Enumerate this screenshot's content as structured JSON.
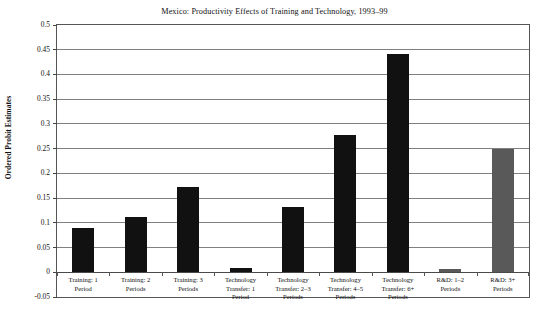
{
  "chart_data": {
    "type": "bar",
    "title": "Mexico: Productivity Effects of Training and Technology, 1993–99",
    "xlabel": "",
    "ylabel": "Ordered Probit Estimates",
    "ylim": [
      -0.05,
      0.5
    ],
    "ytick_step": 0.05,
    "grid": true,
    "legend": "none",
    "categories": [
      "Training: 1 Period",
      "Training: 2 Periods",
      "Training: 3 Periods",
      "Technology Transfer: 1 Period",
      "Technology Transfer: 2–3 Periods",
      "Technology Transfer: 4–5 Periods",
      "Technology Transfer: 6+ Periods",
      "R&D: 1–2 Periods",
      "R&D: 3+ Periods"
    ],
    "category_lines": [
      [
        "Training: 1",
        "Period"
      ],
      [
        "Training: 2",
        "Periods"
      ],
      [
        "Training: 3",
        "Periods"
      ],
      [
        "Technology",
        "Transfer: 1",
        "Period"
      ],
      [
        "Technology",
        "Transfer: 2–3",
        "Periods"
      ],
      [
        "Technology",
        "Transfer: 4–5",
        "Periods"
      ],
      [
        "Technology",
        "Transfer: 6+",
        "Periods"
      ],
      [
        "R&D: 1–2",
        "Periods"
      ],
      [
        "R&D: 3+",
        "Periods"
      ]
    ],
    "values": [
      0.09,
      0.112,
      0.172,
      0.008,
      0.133,
      0.277,
      0.442,
      0.007,
      0.249
    ],
    "bar_colors": [
      "#111111",
      "#111111",
      "#111111",
      "#111111",
      "#111111",
      "#111111",
      "#111111",
      "#595959",
      "#595959"
    ],
    "ytick_labels": [
      "0.5",
      "0.45",
      "0.4",
      "0.35",
      "0.3",
      "0.25",
      "0.2",
      "0.15",
      "0.1",
      "0.05",
      "0",
      "-0.05"
    ],
    "ytick_values": [
      0.5,
      0.45,
      0.4,
      0.35,
      0.3,
      0.25,
      0.2,
      0.15,
      0.1,
      0.05,
      0,
      -0.05
    ]
  },
  "colors": {
    "bar_black": "#111111",
    "bar_gray": "#595959",
    "gridline": "#808080",
    "frame": "#555555",
    "background": "#ffffff"
  }
}
